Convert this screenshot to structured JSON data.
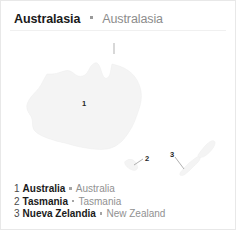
{
  "card": {
    "header": {
      "title_primary": "Australasia",
      "separator": "•",
      "title_secondary": "Australasia"
    },
    "map": {
      "labels": [
        {
          "id": "1",
          "text": "1"
        },
        {
          "id": "2",
          "text": "2"
        },
        {
          "id": "3",
          "text": "3"
        }
      ],
      "land_fill_color": "#f4f4f4",
      "land_stroke_color": "#ececec"
    },
    "legend": {
      "items": [
        {
          "number": "1",
          "name": "Australia",
          "separator": "•",
          "alt_name": "Australia"
        },
        {
          "number": "2",
          "name": "Tasmania",
          "separator": "•",
          "alt_name": "Tasmania"
        },
        {
          "number": "3",
          "name": "Nueva Zelandia",
          "separator": "•",
          "alt_name": "New Zealand"
        }
      ]
    }
  }
}
